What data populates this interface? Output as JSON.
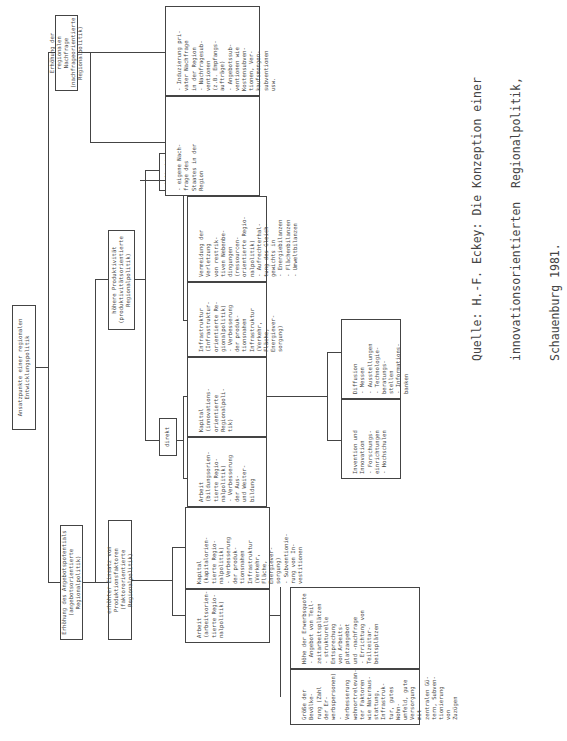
{
  "root": {
    "title": "Ansatzpunkte einer regionalen Entwicklungspolitik"
  },
  "level1": [
    {
      "id": "supply",
      "title": "Erhöhung des Angebotspotentials",
      "subtitle": "(angebotsorientierte Regionalpolitik)"
    },
    {
      "id": "demand",
      "title": "Erhöhung der regionalen Nachfrage",
      "subtitle": "(nachfrageorientierte Regionalpolitik)"
    }
  ],
  "level2": [
    {
      "id": "factor",
      "title": "erhöhter Einsatz von Produktionsfaktoren",
      "subtitle": "(faktororientierte Regionalpolitik)"
    },
    {
      "id": "productivity",
      "title": "höhere Produktivität",
      "subtitle": "(produktivitätsorientierte Regionalpolitik)"
    }
  ],
  "level3": [
    {
      "id": "direkt",
      "label": "direkt"
    },
    {
      "id": "indirekt",
      "label": "indirekt"
    }
  ],
  "leaves": {
    "factor_arbeit": "Arbeit\n(arbeitsorien-\ntierte Regio-\nnalpolitik)",
    "factor_kapital": "Kapital\n(kapitalorien-\ntierte Regio-\nnalpolitik)\n- Verbesserung\n  der produk-\n  tionsnahen\n  Infrastruktur\n  (Verkehr,\n  Fläche,\n  Energiever-\n  sorgung)\n- Subventionie-\n  rung von In-\n  vestitionen",
    "prod_arbeit": "Arbeit\n(bildungsorien-\ntierte Regio-\nnalpolitik)\n- Verbesserung\n  der Aus-\n  und Weiter-\n  bildung",
    "prod_kapital": "Kapital\n(innovations-\norientierte\nRegionalpoli-\ntik)",
    "prod_infra": "Infrastruktur\n(Infrastruktur-\norientierte Re-\ngionalpolitik)\n- Verbesserung\n  der produk-\n  tionsnahen\n  Infrastruktur\n  (Verkehr,\n  Fläche,\n  Energiever-\n  sorgung)",
    "prod_vermeidung": "Vermeidung der\nVerletzung\nvon restrik-\ntiven Nebenbe-\ndingungen\n(ressourcen-\norientierte Regio-\nnalpolitik)\n- Aufrechterhal-\n  tung des Gleich-\n  gewichts in\n  - Energiebilanzen\n  - Flächenbilanzen\n  - Umweltbilanzen",
    "demand_state": "- eigene Nach-\n  frage des\n  Staates in der\n  Region",
    "demand_private": "- Induzierung pri-\n  vater Nachfrage\n  in der Region\n- Nachfragesub-\n  ventionen\n  (z.B. Empfangs-\n  aufträge)\n- Angebotssub-\n  ventionen wie\n  Kostensubven-\n  tionen, Ver-\n  kaufsmengen-\n  subventionen\n  usw.",
    "arbeit_size": "Größe der Bevölke-\nrung (Zahl der Er-\nwerbspersonen)\n- Verbesserung\n  wohnortrelevan-\n  ter Faktoren\n  wie Naturaus-\n  stattung, Infrastruk-\n  tur, gutes Wohn-\n  umfeld, gute\n  Versorgung mit\n  zentralen Gü-\n  tern, Subven-\n  tionierung von\n  Zuzügen",
    "arbeit_quote": "Höhe der Erwerbsquote\n- Angebot von Teil-\n  zeitarbeitsplätzen\n- strukturelle\n  Entsprechung\n  von Arbeits-\n  platzangebot\n  und -nachfrage\n- Errichtung von\n  Teilzeitar-\n  beitsplätzen",
    "innovation": "Invention und\nInnovation\n- Forschungs-\n  einrichtungen\n- Hochschulen",
    "diffusion": "Diffusion\n- Messen\n- Ausstellungen\n- Technologie-\n  beratungs-\n  stellen\n- Informations-\n  banken"
  },
  "source": {
    "line1": "Quelle: H.-F. Eckey: Die Konzeption einer",
    "line2": "innovationsorientierten  Regionalpolitik,",
    "line3": "Schauenburg 1981."
  }
}
